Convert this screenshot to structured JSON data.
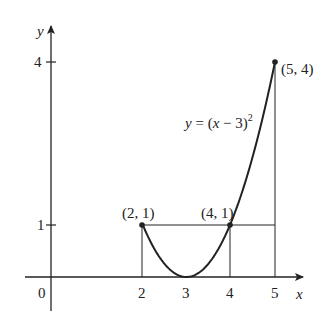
{
  "diagram": {
    "function_label": "y = (x − 3)²",
    "function_parts": {
      "y": "y",
      "eq": " = (",
      "x": "x",
      "rest": " − 3)",
      "exp": "2"
    },
    "axes": {
      "x_label": "x",
      "y_label": "y",
      "origin_label": "0",
      "x_ticks": [
        "2",
        "3",
        "4",
        "5"
      ],
      "y_ticks": [
        "1",
        "4"
      ]
    },
    "points": [
      {
        "label": "(2, 1)",
        "x": 2,
        "y": 1
      },
      {
        "label": "(4, 1)",
        "x": 4,
        "y": 1
      },
      {
        "label": "(5, 4)",
        "x": 5,
        "y": 4
      }
    ],
    "curve": {
      "expression": "(x-3)^2",
      "domain": [
        2,
        5
      ]
    },
    "guide_lines": [
      {
        "from": [
          2,
          0
        ],
        "to": [
          2,
          1
        ]
      },
      {
        "from": [
          4,
          0
        ],
        "to": [
          4,
          1
        ]
      },
      {
        "from": [
          5,
          0
        ],
        "to": [
          5,
          4
        ]
      },
      {
        "from": [
          2,
          1
        ],
        "to": [
          5,
          1
        ]
      }
    ],
    "colors": {
      "ink": "#222222",
      "background": "#ffffff"
    }
  }
}
